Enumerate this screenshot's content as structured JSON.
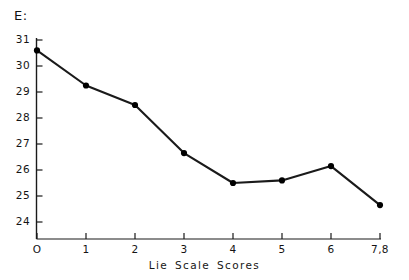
{
  "chart_data": {
    "type": "line",
    "title": "",
    "ylabel": "E:",
    "xlabel": "Lie  Scale  Scores",
    "categories": [
      "O",
      "1",
      "2",
      "3",
      "4",
      "5",
      "6",
      "7,8"
    ],
    "x": [
      0,
      1,
      2,
      3,
      4,
      5,
      6,
      7
    ],
    "values": [
      30.6,
      29.25,
      28.5,
      26.65,
      25.5,
      25.6,
      26.15,
      24.65
    ],
    "y_tick_labels": [
      "31",
      "30",
      "29",
      "28",
      "27",
      "26",
      "25",
      "24"
    ],
    "y_ticks": [
      31,
      30,
      29,
      28,
      27,
      26,
      25,
      24
    ],
    "ylim": [
      23.3,
      31.0
    ],
    "xlim": [
      -0.1,
      7.1
    ],
    "grid": false,
    "legend": null,
    "marker": "filled-circle",
    "line_color": "#1a1a1a",
    "marker_color": "#000000",
    "background_color": "#ffffff"
  },
  "axes": {
    "y_axis_name": "vertical-axis",
    "x_axis_name": "horizontal-axis"
  }
}
